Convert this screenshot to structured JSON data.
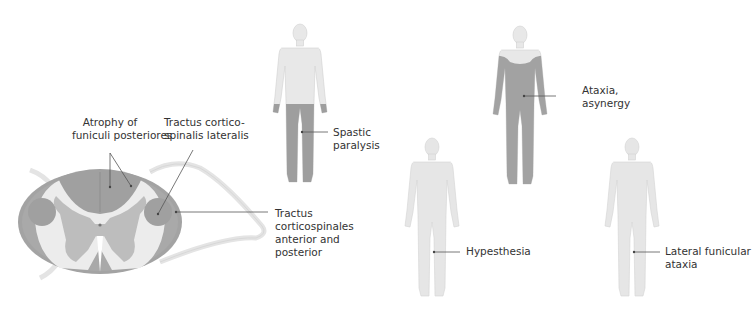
{
  "colors": {
    "background": "#ffffff",
    "skin_light": "#e6e6e6",
    "skin_outline": "#d2d2d2",
    "affected": "#9d9d9d",
    "cord_white": "#eeeeee",
    "cord_gray": "#bdbdbd",
    "cord_dark": "#9a9a9a",
    "leader_line": "#555555",
    "text": "#333333"
  },
  "cross_section": {
    "labels": {
      "posterior_funiculi": "Atrophy of\nfuniculi posteriores",
      "posterior_funiculi_l1": "Atrophy of",
      "posterior_funiculi_l2": "funiculi posteriores",
      "lateral_tract_l1": "Tractus cortico-",
      "lateral_tract_l2": "spinalis lateralis",
      "ant_post_tract_l1": "Tractus",
      "ant_post_tract_l2": "corticospinales",
      "ant_post_tract_l3": "anterior and",
      "ant_post_tract_l4": "posterior"
    }
  },
  "figures": [
    {
      "id": "spastic",
      "label_l1": "Spastic",
      "label_l2": "paralysis",
      "affected_region": "legs"
    },
    {
      "id": "ataxia",
      "label_l1": "Ataxia,",
      "label_l2": "asynergy",
      "affected_region": "trunk-and-limbs"
    },
    {
      "id": "hypesthesia",
      "label_l1": "Hypesthesia",
      "label_l2": "",
      "affected_region": "whole-body-light"
    },
    {
      "id": "lateral",
      "label_l1": "Lateral funicular",
      "label_l2": "ataxia",
      "affected_region": "whole-body-light"
    }
  ]
}
